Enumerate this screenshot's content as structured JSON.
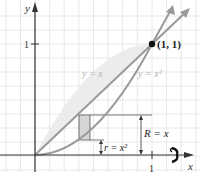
{
  "figure": {
    "axes": {
      "x_label": "x",
      "y_label": "y",
      "x_tick_label": "1",
      "y_tick_label": "1"
    },
    "curves": [
      {
        "label": "y = x",
        "type": "line"
      },
      {
        "label": "y = x²",
        "type": "parabola"
      }
    ],
    "point": {
      "label": "(1, 1)"
    },
    "annotations": {
      "outer_radius": "R = x",
      "inner_radius": "r = x²"
    },
    "rotation_icon": "rotation-about-x-axis-icon",
    "colors": {
      "grid": "#e2e2e2",
      "axis": "#333333",
      "curve": "#9a9a9a",
      "region_fill": "#ececec",
      "rect_fill": "#d6d6d6",
      "point": "#111111"
    }
  }
}
